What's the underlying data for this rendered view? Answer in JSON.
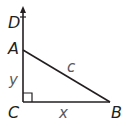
{
  "diagram": {
    "type": "right-triangle",
    "points": {
      "D": {
        "label": "D"
      },
      "A": {
        "label": "A"
      },
      "C": {
        "label": "C"
      },
      "B": {
        "label": "B"
      }
    },
    "sides": {
      "AC": {
        "label": "y"
      },
      "CB": {
        "label": "x"
      },
      "AB": {
        "label": "c"
      }
    },
    "right_angle_at": "C",
    "ray": "CD",
    "colors": {
      "line": "#231f20",
      "variable_text": "#58595b"
    }
  }
}
